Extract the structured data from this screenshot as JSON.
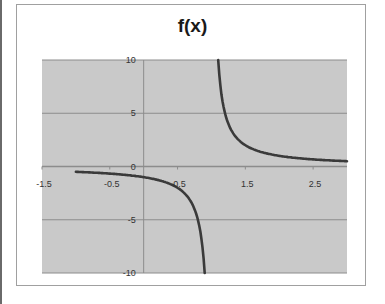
{
  "chart_data": {
    "type": "line",
    "title": "f(x)",
    "function": "1/(x-1)",
    "xlabel": "",
    "ylabel": "",
    "xlim": [
      -1.5,
      3.0
    ],
    "ylim": [
      -10,
      10
    ],
    "x_tick_labels": [
      "-1.5",
      "-0.5",
      "0.5",
      "1.5",
      "2.5"
    ],
    "x_ticks": [
      -1.5,
      -0.5,
      0.5,
      1.5,
      2.5
    ],
    "y_tick_labels": [
      "10",
      "5",
      "0",
      "-5",
      "-10"
    ],
    "y_ticks": [
      10,
      5,
      0,
      -5,
      -10
    ],
    "grid": true,
    "legend": null,
    "series": [
      {
        "name": "f(x)",
        "segments": [
          {
            "x": [
              -1.0,
              -0.5,
              0.0,
              0.25,
              0.5,
              0.6,
              0.7,
              0.8,
              0.85,
              0.9
            ],
            "y": [
              -0.5,
              -0.667,
              -1.0,
              -1.333,
              -2.0,
              -2.5,
              -3.333,
              -5.0,
              -6.667,
              -10.0
            ]
          },
          {
            "x": [
              1.1,
              1.15,
              1.2,
              1.3,
              1.4,
              1.5,
              1.75,
              2.0,
              2.5,
              3.0
            ],
            "y": [
              10.0,
              6.667,
              5.0,
              3.333,
              2.5,
              2.0,
              1.333,
              1.0,
              0.667,
              0.5
            ]
          }
        ]
      }
    ],
    "colors": {
      "plot_background": "#c9c9c9",
      "gridline": "#8c8c8c",
      "curve": "#3a3a3a",
      "frame": "#a0a0a0"
    }
  }
}
